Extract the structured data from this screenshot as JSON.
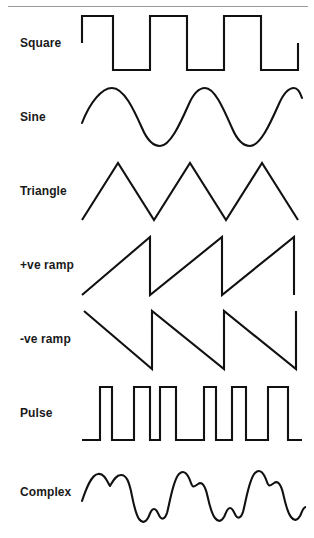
{
  "figure": {
    "stroke_color": "#111111",
    "rule_color": "#9a9a9a",
    "background": "#ffffff"
  },
  "rows": [
    {
      "label": "Square",
      "type": "square",
      "cycles": 3,
      "description": "Square wave: instantaneous transitions between high and low levels, 50% duty cycle",
      "path": "M 2,37 L 2,10 L 33,10 L 33,64 L 70,64 L 70,10 L 107,10 L 107,64 L 144,64 L 144,10 L 181,10 L 181,64 L 218,64 L 218,37"
    },
    {
      "label": "Sine",
      "type": "sine",
      "cycles": 3,
      "description": "Sine wave: smooth sinusoidal oscillation",
      "path": "M 2,43 C 10,22 22,8 32,8 C 44,8 54,30 62,48 C 68,62 74,66 80,66 C 90,66 100,44 108,26 C 113,14 119,8 125,8 C 135,8 144,30 152,48 C 158,62 164,66 170,66 C 180,66 190,44 198,26 C 203,14 209,8 214,8 C 218,8 220,12 222,18"
    },
    {
      "label": "Triangle",
      "type": "triangle",
      "cycles": 3,
      "description": "Triangle wave: linear rise and linear fall, symmetric ramps",
      "path": "M 2,66 L 38,9 L 74,66 L 110,9 L 146,66 L 182,9 L 218,66"
    },
    {
      "label": "+ve ramp",
      "type": "positive-ramp",
      "cycles": 3,
      "description": "Positive-going sawtooth: linear rise then instantaneous fall",
      "path": "M 2,67 L 70,9 L 70,67 L 142,9 L 142,67 L 214,9 L 214,67"
    },
    {
      "label": "-ve ramp",
      "type": "negative-ramp",
      "cycles": 3,
      "description": "Negative-going sawtooth: linear fall then instantaneous rise",
      "path": "M 4,9 L 72,67 L 72,9 L 144,67 L 144,9 L 216,67 L 216,9"
    },
    {
      "label": "Pulse",
      "type": "pulse",
      "pulses": 6,
      "description": "Pulse train: narrow high pulses with low duty cycle and uneven spacing",
      "path": "M 2,64 L 20,64 L 20,11 L 32,11 L 32,64 L 54,64 L 54,11 L 70,11 L 70,64 L 80,64 L 80,11 L 96,11 L 96,64 L 124,64 L 124,11 L 136,11 L 136,64 L 152,64 L 152,11 L 166,11 L 166,64 L 188,64 L 188,11 L 208,11 L 208,64 L 222,64"
    },
    {
      "label": "Complex",
      "type": "complex",
      "cycles": 3,
      "description": "Complex waveform: fundamental with harmonics producing double humps and a bump in each trough",
      "path": "M 2,46 C 6,34 11,20 18,19 C 24,18 27,26 30,31 C 33,26 36,20 41,20 C 47,20 49,28 51,36 C 53,46 55,58 59,64 C 62,68 65,68 68,63 C 70,59 71,54 74,54 C 77,54 78,59 80,62 C 82,65 85,64 87,58 C 90,47 93,25 99,19 C 104,14 108,19 111,28 C 113,34 115,31 118,29 C 122,26 125,31 127,39 C 129,48 131,58 135,63 C 138,67 141,67 144,62 C 146,58 147,53 150,53 C 153,53 154,58 156,61 C 158,64 161,63 163,57 C 166,46 169,24 175,18 C 180,13 184,18 187,27 C 189,33 191,30 194,28 C 198,25 201,30 203,38 C 205,47 207,57 211,62 C 214,66 217,66 220,61 C 222,57 223,52 226,52"
    }
  ]
}
